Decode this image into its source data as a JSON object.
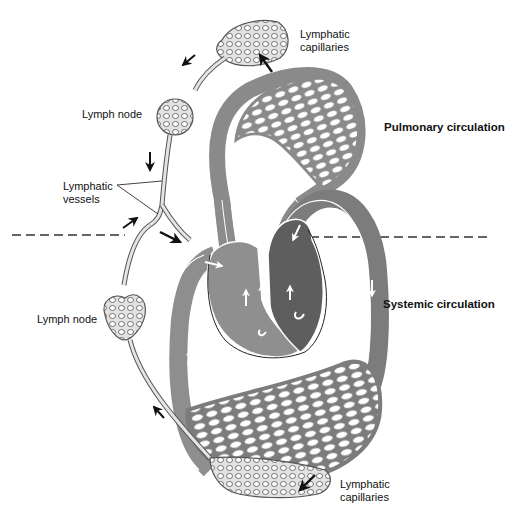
{
  "diagram": {
    "colors": {
      "lymph_fill": "#e4e4e4",
      "lymph_stroke": "#555555",
      "pulmonary_vessels": "#8c8c8c",
      "systemic_vessels": "#7a7a7a",
      "right_heart": "#8f8f8f",
      "left_heart": "#5e5e5e",
      "arrow": "#111111",
      "dashed_line": "#333333"
    },
    "labels": {
      "lymphatic_capillaries_top_line1": "Lymphatic",
      "lymphatic_capillaries_top_line2": "capillaries",
      "lymph_node_top": "Lymph node",
      "pulmonary_circulation": "Pulmonary circulation",
      "lymphatic_vessels_line1": "Lymphatic",
      "lymphatic_vessels_line2": "vessels",
      "systemic_circulation": "Systemic circulation",
      "lymph_node_bottom": "Lymph node",
      "lymphatic_capillaries_bottom_line1": "Lymphatic",
      "lymphatic_capillaries_bottom_line2": "capillaries"
    }
  }
}
